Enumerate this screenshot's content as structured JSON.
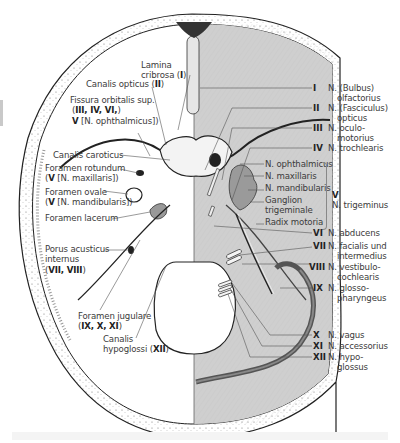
{
  "figure": {
    "colors": {
      "bone_left": "#ffffff",
      "dura_right": "#cfcfcf",
      "outline": "#222222",
      "label_text": "#3b3b3b",
      "leader_line": "#555555"
    }
  },
  "left_labels": {
    "lamina_cribrosa": {
      "line1": "Lamina",
      "line2": "cribrosa",
      "nerve": "I"
    },
    "canalis_opticus": {
      "text": "Canalis opticus",
      "nerve": "II"
    },
    "fissura_orbitalis": {
      "line1": "Fissura orbitalis sup.",
      "nerves": "III, IV, VI,",
      "line3_bold": "V",
      "line3_rest": "[N. ophthalmicus])"
    },
    "canalis_caroticus": {
      "text": "Canalis caroticus"
    },
    "foramen_rotundum": {
      "line1": "Foramen rotundum",
      "bold": "V",
      "rest": "[N. maxillaris])"
    },
    "foramen_ovale": {
      "line1": "Foramen ovale",
      "bold": "V",
      "rest": "[N. mandibularis])"
    },
    "foramen_lacerum": {
      "text": "Foramen lacerum"
    },
    "porus_acusticus": {
      "line1": "Porus acusticus",
      "line2": "internus",
      "nerves": "VII, VIII"
    },
    "foramen_jugulare": {
      "line1": "Foramen jugulare",
      "nerves": "IX, X, XI"
    },
    "canalis_hypoglossi": {
      "line1": "Canalis",
      "line2": "hypoglossi",
      "nerve": "XII"
    }
  },
  "right_labels": [
    {
      "numeral": "I",
      "line1": "N. (Bulbus)",
      "line2": "olfactorius"
    },
    {
      "numeral": "II",
      "line1": "N. (Fasciculus)",
      "line2": "opticus"
    },
    {
      "numeral": "III",
      "line1": "N. oculo-",
      "line2": "motorius"
    },
    {
      "numeral": "IV",
      "line1": "N. trochlearis"
    },
    {
      "numeral": "VI",
      "line1": "N. abducens"
    },
    {
      "numeral": "VII",
      "line1": "N. facialis und",
      "line2": "intermedius"
    },
    {
      "numeral": "VIII",
      "line1": "N. vestibulo-",
      "line2": "cochlearis"
    },
    {
      "numeral": "IX",
      "line1": "N. glosso-",
      "line2": "pharyngeus"
    },
    {
      "numeral": "X",
      "line1": "N. vagus"
    },
    {
      "numeral": "XI",
      "line1": "N. accessorius"
    },
    {
      "numeral": "XII",
      "line1": "N. hypo-",
      "line2": "glossus"
    }
  ],
  "trigeminus_group": {
    "branches": [
      "N. ophthalmicus",
      "N. maxillaris",
      "N. mandibularis",
      "Ganglion",
      "trigeminale",
      "Radix motoria"
    ],
    "numeral": "V",
    "name": "N. trigeminus"
  }
}
